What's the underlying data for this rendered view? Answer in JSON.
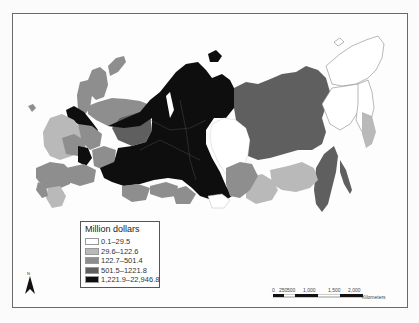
{
  "map": {
    "subject": "Russian regions choropleth",
    "colors": {
      "class1": "#ffffff",
      "class2": "#b9b9b9",
      "class3": "#8e8e8e",
      "class4": "#5f5f5f",
      "class5": "#0e0e0e",
      "border": "#e8e8e8",
      "outline": "#777777"
    }
  },
  "legend": {
    "title": "Million dollars",
    "items": [
      {
        "label": "0.1–29.5",
        "color": "#ffffff"
      },
      {
        "label": "29.6–122.6",
        "color": "#b9b9b9"
      },
      {
        "label": "122.7–501.4",
        "color": "#8e8e8e"
      },
      {
        "label": "501.5–1221.8",
        "color": "#5f5f5f"
      },
      {
        "label": "1,221.9–22,946.8",
        "color": "#0e0e0e"
      }
    ]
  },
  "north_arrow": {
    "label": "N"
  },
  "scale_bar": {
    "ticks": [
      "0",
      "250",
      "500",
      "1,000",
      "1,500",
      "2,000"
    ],
    "unit": "Kilometers"
  }
}
